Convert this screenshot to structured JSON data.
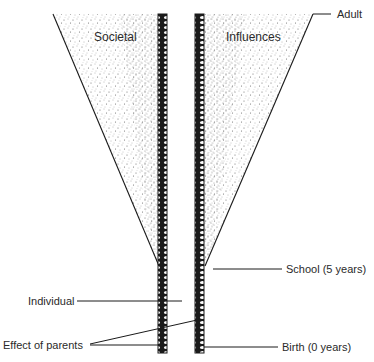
{
  "diagram": {
    "type": "funnel-development",
    "region_labels": {
      "left": "Societal",
      "right": "Influences"
    },
    "annotations": {
      "adult": "Adult",
      "school": "School (5 years)",
      "birth": "Birth (0 years)",
      "individual": "Individual",
      "parents": "Effect of parents"
    },
    "colors": {
      "line": "#1a1a1a",
      "stipple": "#6a6a6a",
      "text": "#2a2a2a",
      "background": "#ffffff"
    }
  }
}
